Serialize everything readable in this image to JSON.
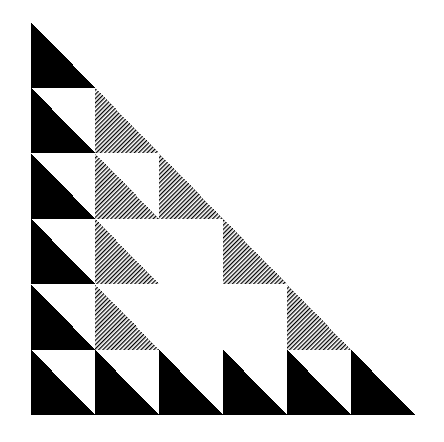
{
  "artwork": {
    "title": "Sierpinski-style right triangle tiling",
    "description": "Black and line-hatched right triangles arranged in a 6 by 6 staircase grid forming a large right triangle.",
    "canvas": {
      "width": 444,
      "height": 442,
      "background_color": "#ffffff"
    },
    "figure": {
      "origin_x": 31,
      "origin_y": 22,
      "width": 384,
      "height": 393,
      "rows": 6,
      "columns": 6,
      "cell_width": 64,
      "cell_height": 65.5,
      "triangle_orientation": "right-angle at bottom-left; hypotenuse from top-left vertex to bottom-right vertex; filled region is the lower-left half"
    },
    "colors": {
      "fill_solid": "#000000",
      "fill_hatch_line": "#000000",
      "fill_hatch_background": "#ffffff",
      "empty": "#ffffff"
    },
    "hatch": {
      "style": "parallel diagonal lines",
      "angle_degrees": -45,
      "period_px": 3,
      "line_width_px": 1.2
    },
    "legend": {
      "solid_label": "solid",
      "hatch_label": "hatched",
      "empty_label": "empty"
    },
    "grid": [
      [
        "solid",
        "empty",
        "empty",
        "empty",
        "empty",
        "empty"
      ],
      [
        "solid",
        "hatch",
        "empty",
        "empty",
        "empty",
        "empty"
      ],
      [
        "solid",
        "hatch",
        "hatch",
        "empty",
        "empty",
        "empty"
      ],
      [
        "solid",
        "hatch",
        "empty",
        "hatch",
        "empty",
        "empty"
      ],
      [
        "solid",
        "hatch",
        "empty",
        "empty",
        "hatch",
        "empty"
      ],
      [
        "solid",
        "solid",
        "solid",
        "solid",
        "solid",
        "solid"
      ]
    ],
    "counts": {
      "solid_triangles": 11,
      "hatched_triangles": 7,
      "empty_cells": 18,
      "total_cells": 36
    }
  }
}
